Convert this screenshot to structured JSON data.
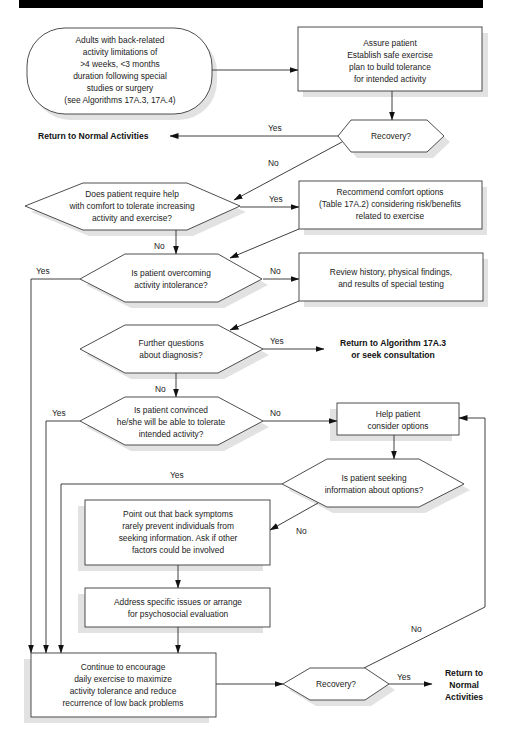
{
  "header": {
    "bar_color": "#000000"
  },
  "nodes": {
    "start": {
      "lines": [
        "Adults with back-related",
        "activity limitations of",
        ">4 weeks, <3 months",
        "duration following special",
        "studies or surgery",
        "(see Algorithms 17A.3, 17A.4)"
      ]
    },
    "assure": {
      "lines": [
        "Assure patient",
        "Establish safe exercise",
        "plan to build tolerance",
        "for intended activity"
      ]
    },
    "recovery1": {
      "lines": [
        "Recovery?"
      ]
    },
    "return_normal_1": {
      "text": "Return to Normal Activities"
    },
    "comfort_q": {
      "lines": [
        "Does patient require help",
        "with comfort to tolerate increasing",
        "activity and exercise?"
      ]
    },
    "recommend": {
      "lines": [
        "Recommend comfort options",
        "(Table 17A.2) considering risk/benefits",
        "related to exercise"
      ]
    },
    "overcoming_q": {
      "lines": [
        "Is patient overcoming",
        "activity intolerance?"
      ]
    },
    "review": {
      "lines": [
        "Review history, physical findings,",
        "and results of special testing"
      ]
    },
    "further_q": {
      "lines": [
        "Further questions",
        "about diagnosis?"
      ]
    },
    "return_algo": {
      "lines": [
        "Return to Algorithm 17A.3",
        "or seek consultation"
      ]
    },
    "convinced_q": {
      "lines": [
        "Is patient convinced",
        "he/she will be able to tolerate",
        "intended activity?"
      ]
    },
    "help": {
      "lines": [
        "Help patient",
        "consider options"
      ]
    },
    "seeking_q": {
      "lines": [
        "Is patient seeking",
        "information about options?"
      ]
    },
    "point_out": {
      "lines": [
        "Point out that back symptoms",
        "rarely prevent individuals from",
        "seeking information. Ask if other",
        "factors could be involved"
      ]
    },
    "address": {
      "lines": [
        "Address specific issues or arrange",
        "for psychosocial evaluation"
      ]
    },
    "continue": {
      "lines": [
        "Continue to encourage",
        "daily exercise to maximize",
        "activity tolerance and reduce",
        "recurrence of low back problems"
      ]
    },
    "recovery2": {
      "lines": [
        "Recovery?"
      ]
    },
    "return_normal_2": {
      "lines": [
        "Return to",
        "Normal",
        "Activities"
      ]
    }
  },
  "edge_labels": {
    "recovery1_yes": "Yes",
    "recovery1_no": "No",
    "comfort_yes": "Yes",
    "comfort_no": "No",
    "overcoming_yes": "Yes",
    "overcoming_no": "No",
    "further_yes": "Yes",
    "further_no": "No",
    "convinced_yes": "Yes",
    "convinced_no": "No",
    "seeking_yes": "Yes",
    "seeking_no": "No",
    "recovery2_yes": "Yes",
    "recovery2_no": "No"
  }
}
